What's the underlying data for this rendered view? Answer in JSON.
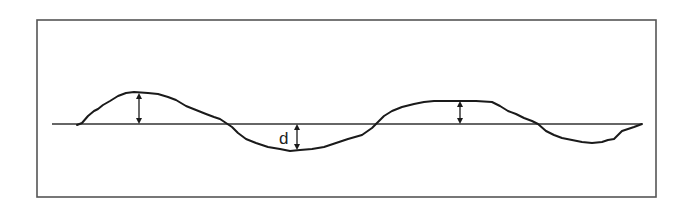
{
  "diagram": {
    "frame": {
      "stroke": "#555555"
    },
    "mean_line": {
      "label": ""
    },
    "profile": {
      "stroke": "#1a1a1a"
    },
    "deviation_label": "d",
    "arrows": [
      {
        "name": "peak-1-deviation",
        "direction": "above-line"
      },
      {
        "name": "trough-1-deviation",
        "direction": "below-line",
        "label": "d"
      },
      {
        "name": "peak-2-deviation",
        "direction": "above-line"
      }
    ]
  }
}
